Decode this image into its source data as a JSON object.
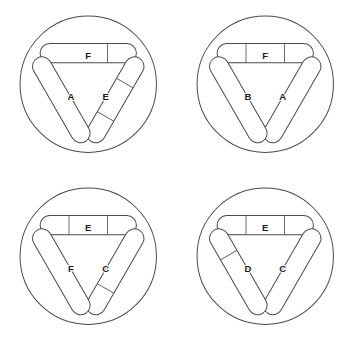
{
  "figure": {
    "panel_count": 4,
    "grid": {
      "columns": 2,
      "rows": 2
    },
    "colors": {
      "background": "#ffffff",
      "outline": "#4a4a4a",
      "bar_fill": "#ffffff",
      "shading_stipple": "#8c8c8c",
      "label_text": "#1c1c1c"
    },
    "geometry": {
      "circle_radius": 68,
      "bar_length": 96,
      "bar_thickness": 19,
      "shaded_cap_fraction": 0.3
    },
    "legend": {
      "shaded_meaning": "stippled end",
      "plain_meaning": "plain end"
    }
  },
  "panels": [
    {
      "id": "panel-1",
      "position": "top-left",
      "bars": [
        {
          "label": "F",
          "slot": "top-horizontal",
          "rotation": 0,
          "shaded_ends": [
            "right"
          ],
          "shaded_count": 1
        },
        {
          "label": "E",
          "slot": "left-diagonal",
          "rotation": 120,
          "shaded_ends": [
            "top",
            "bottom"
          ],
          "shaded_count": 2
        },
        {
          "label": "A",
          "slot": "right-diagonal",
          "rotation": 240,
          "shaded_ends": [],
          "shaded_count": 0
        }
      ]
    },
    {
      "id": "panel-2",
      "position": "top-right",
      "bars": [
        {
          "label": "F",
          "slot": "top-horizontal",
          "rotation": 0,
          "shaded_ends": [
            "left",
            "right"
          ],
          "shaded_count": 2
        },
        {
          "label": "A",
          "slot": "left-diagonal",
          "rotation": 120,
          "shaded_ends": [],
          "shaded_count": 0
        },
        {
          "label": "B",
          "slot": "right-diagonal",
          "rotation": 240,
          "shaded_ends": [],
          "shaded_count": 0
        }
      ]
    },
    {
      "id": "panel-3",
      "position": "bottom-left",
      "bars": [
        {
          "label": "E",
          "slot": "top-horizontal",
          "rotation": 0,
          "shaded_ends": [
            "left",
            "right"
          ],
          "shaded_count": 2
        },
        {
          "label": "C",
          "slot": "left-diagonal",
          "rotation": 120,
          "shaded_ends": [
            "bottom"
          ],
          "shaded_count": 1
        },
        {
          "label": "F",
          "slot": "right-diagonal",
          "rotation": 240,
          "shaded_ends": [],
          "shaded_count": 0
        }
      ]
    },
    {
      "id": "panel-4",
      "position": "bottom-right",
      "bars": [
        {
          "label": "E",
          "slot": "top-horizontal",
          "rotation": 0,
          "shaded_ends": [
            "left",
            "right"
          ],
          "shaded_count": 2
        },
        {
          "label": "C",
          "slot": "left-diagonal",
          "rotation": 120,
          "shaded_ends": [],
          "shaded_count": 0
        },
        {
          "label": "D",
          "slot": "right-diagonal",
          "rotation": 240,
          "shaded_ends": [
            "bottom"
          ],
          "shaded_count": 1
        }
      ]
    }
  ]
}
